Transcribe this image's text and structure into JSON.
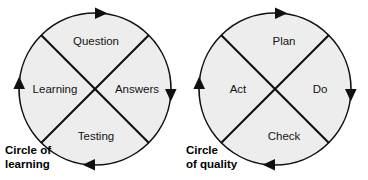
{
  "page": {
    "background_color": "#ffffff",
    "width": 368,
    "height": 180
  },
  "style": {
    "circle_fill": "#ededed",
    "line_color": "#101010",
    "label_color": "#141414",
    "caption_color": "#000000"
  },
  "diagrams": [
    {
      "id": "circle-of-learning",
      "caption_line1": "Circle of",
      "caption_line2": "learning",
      "rotation": "clockwise",
      "segments": [
        {
          "position": "top",
          "label": "Question"
        },
        {
          "position": "right",
          "label": "Answers"
        },
        {
          "position": "bottom",
          "label": "Testing"
        },
        {
          "position": "left",
          "label": "Learning"
        }
      ]
    },
    {
      "id": "circle-of-quality",
      "caption_line1": "Circle",
      "caption_line2": "of quality",
      "rotation": "clockwise",
      "segments": [
        {
          "position": "top",
          "label": "Plan"
        },
        {
          "position": "right",
          "label": "Do"
        },
        {
          "position": "bottom",
          "label": "Check"
        },
        {
          "position": "left",
          "label": "Act"
        }
      ]
    }
  ]
}
